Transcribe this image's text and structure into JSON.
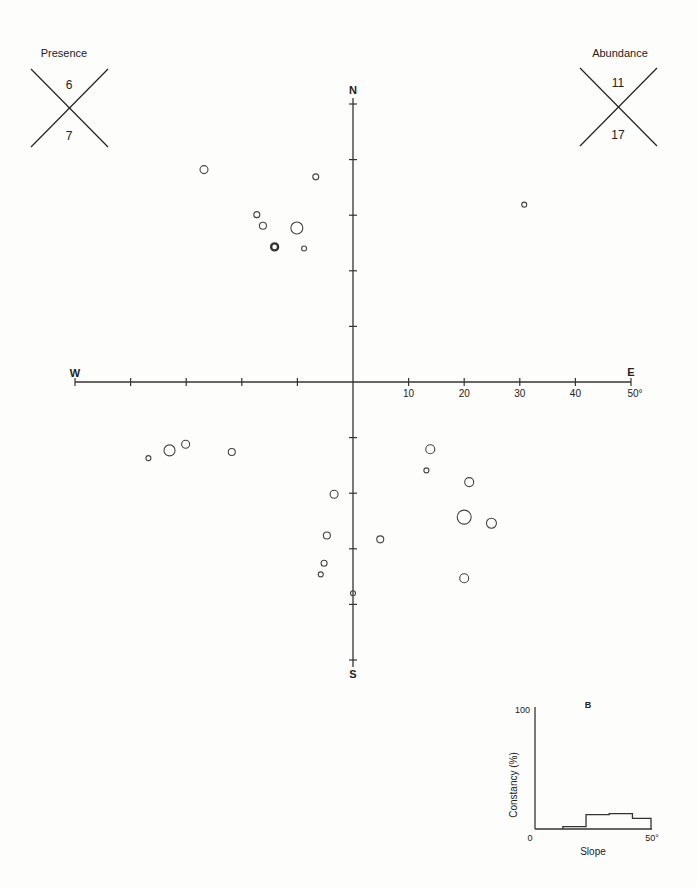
{
  "chart_data": {
    "type": "scatter",
    "title": "",
    "subtitle": "Polar plot of sample aspect (direction) and slope (degrees)",
    "xlabel": "W — E",
    "ylabel": "S — N",
    "compass": {
      "north": "N",
      "south": "S",
      "east": "E",
      "west": "W"
    },
    "axis_range_deg": [
      -50,
      50
    ],
    "tick_step_deg": 10,
    "tick_labels_east": [
      "10",
      "20",
      "30",
      "40",
      "50°"
    ],
    "grid": false,
    "legend": [
      {
        "name": "Presence",
        "upper": "6",
        "lower": "7"
      },
      {
        "name": "Abundance",
        "upper": "11",
        "lower": "17"
      }
    ],
    "points": [
      {
        "x": -26.8,
        "y": 38.2,
        "r": 4
      },
      {
        "x": -6.7,
        "y": 36.9,
        "r": 3
      },
      {
        "x": -17.3,
        "y": 30.1,
        "r": 3
      },
      {
        "x": -16.2,
        "y": 28.1,
        "r": 3.5
      },
      {
        "x": -10.1,
        "y": 27.7,
        "r": 6
      },
      {
        "x": -14.1,
        "y": 24.3,
        "r": 3.5,
        "bold": true
      },
      {
        "x": -8.8,
        "y": 24.0,
        "r": 2.5
      },
      {
        "x": 30.8,
        "y": 31.9,
        "r": 2.5
      },
      {
        "x": -36.8,
        "y": -13.7,
        "r": 2.5
      },
      {
        "x": -33.0,
        "y": -12.3,
        "r": 5.5
      },
      {
        "x": -30.1,
        "y": -11.2,
        "r": 4
      },
      {
        "x": -21.8,
        "y": -12.6,
        "r": 3.5
      },
      {
        "x": -3.4,
        "y": -20.2,
        "r": 4
      },
      {
        "x": -4.7,
        "y": -27.6,
        "r": 3.5
      },
      {
        "x": -5.2,
        "y": -32.6,
        "r": 3
      },
      {
        "x": -5.8,
        "y": -34.6,
        "r": 2.5
      },
      {
        "x": 0.0,
        "y": -38.0,
        "r": 2.5
      },
      {
        "x": 4.9,
        "y": -28.3,
        "r": 3.5
      },
      {
        "x": 13.9,
        "y": -12.1,
        "r": 4.5
      },
      {
        "x": 13.2,
        "y": -15.9,
        "r": 2.5
      },
      {
        "x": 20.9,
        "y": -18.0,
        "r": 4.5
      },
      {
        "x": 20.0,
        "y": -24.3,
        "r": 7
      },
      {
        "x": 24.9,
        "y": -25.4,
        "r": 5
      },
      {
        "x": 20.0,
        "y": -35.3,
        "r": 4.5
      }
    ],
    "inset": {
      "type": "step",
      "panel_label": "B",
      "xlabel": "Slope",
      "ylabel": "Constancy (%)",
      "x_tick_labels": [
        "0",
        "50°"
      ],
      "y_tick_labels": [
        "0",
        "100"
      ],
      "xlim": [
        0,
        50
      ],
      "ylim": [
        0,
        100
      ],
      "bins": [
        {
          "from": 0,
          "to": 12,
          "value": 0
        },
        {
          "from": 12,
          "to": 22,
          "value": 2
        },
        {
          "from": 22,
          "to": 32,
          "value": 12
        },
        {
          "from": 32,
          "to": 42,
          "value": 13
        },
        {
          "from": 42,
          "to": 50,
          "value": 9
        }
      ]
    }
  }
}
